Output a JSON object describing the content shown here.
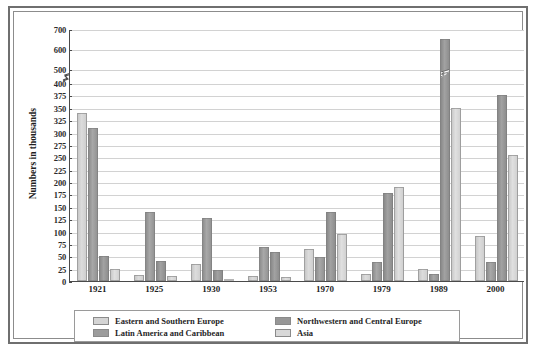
{
  "chart_data": {
    "type": "bar",
    "title": "",
    "xlabel": "",
    "ylabel": "Numbers in thousands",
    "categories": [
      "1921",
      "1925",
      "1930",
      "1953",
      "1970",
      "1979",
      "1989",
      "2000"
    ],
    "yticks": [
      0,
      25,
      50,
      75,
      100,
      125,
      150,
      175,
      200,
      225,
      250,
      275,
      300,
      325,
      350,
      375,
      400,
      500,
      600,
      700
    ],
    "ylim": [
      0,
      700
    ],
    "axis_break": {
      "between": [
        400,
        500
      ],
      "note": "broken y-axis scale"
    },
    "grid": true,
    "legend_position": "bottom",
    "series": [
      {
        "name": "Eastern and Southern Europe",
        "color": "#d4d4d4",
        "values": [
          340,
          12,
          35,
          10,
          65,
          15,
          25,
          90
        ]
      },
      {
        "name": "Latin America and Caribbean",
        "color": "#9c9c9c",
        "values": [
          310,
          140,
          128,
          68,
          48,
          38,
          15,
          38
        ]
      },
      {
        "name": "Northwestern and Central Europe",
        "color": "#979797",
        "values": [
          50,
          40,
          22,
          58,
          140,
          178,
          650,
          375
        ]
      },
      {
        "name": "Asia",
        "color": "#d8d8d8",
        "values": [
          25,
          10,
          5,
          8,
          95,
          190,
          350,
          255
        ]
      }
    ],
    "legend_layout": [
      [
        "Eastern and Southern Europe",
        "Northwestern and Central Europe"
      ],
      [
        "Latin America and Caribbean",
        "Asia"
      ]
    ]
  }
}
